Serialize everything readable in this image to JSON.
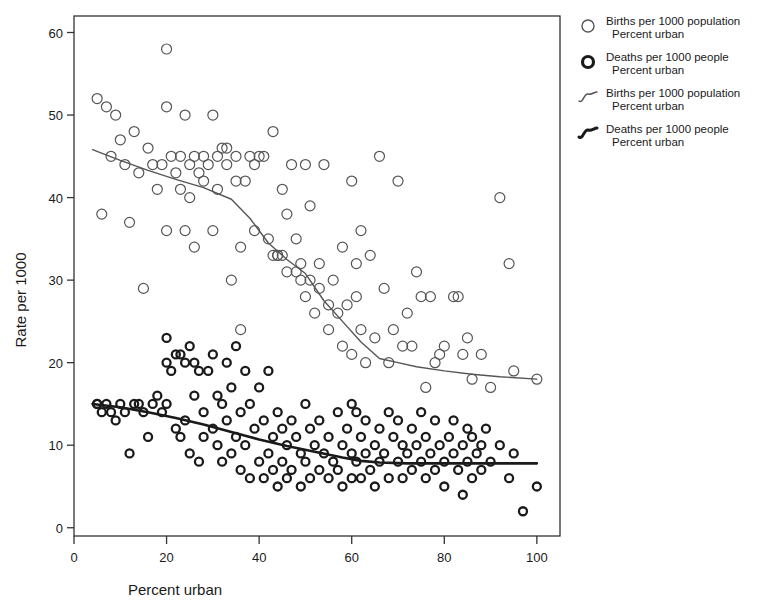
{
  "chart_data": {
    "type": "scatter",
    "title": "",
    "xlabel": "Percent urban",
    "ylabel": "Rate per 1000",
    "xlim": [
      0,
      105
    ],
    "ylim": [
      -1,
      62
    ],
    "xticks": [
      0,
      20,
      40,
      60,
      80,
      100
    ],
    "yticks": [
      0,
      10,
      20,
      30,
      40,
      50,
      60
    ],
    "grid": false,
    "legend_position": "right",
    "series": [
      {
        "name": "Births per 1000 population",
        "sub": "Percent urban",
        "marker": "open-circle",
        "color": "#555555",
        "points": [
          [
            5,
            52
          ],
          [
            6,
            38
          ],
          [
            7,
            51
          ],
          [
            8,
            45
          ],
          [
            9,
            50
          ],
          [
            10,
            47
          ],
          [
            11,
            44
          ],
          [
            12,
            37
          ],
          [
            13,
            48
          ],
          [
            14,
            43
          ],
          [
            15,
            29
          ],
          [
            16,
            46
          ],
          [
            17,
            44
          ],
          [
            18,
            41
          ],
          [
            19,
            44
          ],
          [
            20,
            58
          ],
          [
            20,
            51
          ],
          [
            20,
            36
          ],
          [
            21,
            45
          ],
          [
            22,
            43
          ],
          [
            23,
            45
          ],
          [
            23,
            41
          ],
          [
            24,
            50
          ],
          [
            24,
            36
          ],
          [
            25,
            44
          ],
          [
            25,
            40
          ],
          [
            26,
            45
          ],
          [
            26,
            34
          ],
          [
            27,
            43
          ],
          [
            28,
            42
          ],
          [
            28,
            45
          ],
          [
            29,
            44
          ],
          [
            30,
            50
          ],
          [
            30,
            36
          ],
          [
            31,
            45
          ],
          [
            31,
            41
          ],
          [
            32,
            46
          ],
          [
            33,
            44
          ],
          [
            33,
            46
          ],
          [
            34,
            30
          ],
          [
            35,
            45
          ],
          [
            35,
            42
          ],
          [
            36,
            34
          ],
          [
            36,
            24
          ],
          [
            37,
            42
          ],
          [
            38,
            45
          ],
          [
            39,
            44
          ],
          [
            39,
            36
          ],
          [
            40,
            45
          ],
          [
            41,
            45
          ],
          [
            42,
            35
          ],
          [
            43,
            48
          ],
          [
            43,
            33
          ],
          [
            44,
            33
          ],
          [
            44,
            33
          ],
          [
            45,
            33
          ],
          [
            45,
            41
          ],
          [
            46,
            38
          ],
          [
            46,
            31
          ],
          [
            47,
            44
          ],
          [
            48,
            35
          ],
          [
            48,
            31
          ],
          [
            49,
            30
          ],
          [
            49,
            32
          ],
          [
            50,
            44
          ],
          [
            50,
            28
          ],
          [
            51,
            39
          ],
          [
            51,
            30
          ],
          [
            52,
            26
          ],
          [
            53,
            32
          ],
          [
            53,
            29
          ],
          [
            54,
            44
          ],
          [
            55,
            24
          ],
          [
            55,
            27
          ],
          [
            56,
            30
          ],
          [
            57,
            26
          ],
          [
            58,
            22
          ],
          [
            58,
            34
          ],
          [
            59,
            27
          ],
          [
            60,
            42
          ],
          [
            60,
            21
          ],
          [
            61,
            32
          ],
          [
            61,
            28
          ],
          [
            62,
            36
          ],
          [
            62,
            24
          ],
          [
            63,
            20
          ],
          [
            64,
            33
          ],
          [
            65,
            23
          ],
          [
            66,
            45
          ],
          [
            67,
            29
          ],
          [
            68,
            20
          ],
          [
            69,
            24
          ],
          [
            70,
            42
          ],
          [
            71,
            22
          ],
          [
            72,
            26
          ],
          [
            73,
            22
          ],
          [
            74,
            31
          ],
          [
            75,
            28
          ],
          [
            76,
            17
          ],
          [
            77,
            28
          ],
          [
            78,
            20
          ],
          [
            79,
            21
          ],
          [
            80,
            22
          ],
          [
            82,
            28
          ],
          [
            83,
            28
          ],
          [
            84,
            21
          ],
          [
            85,
            23
          ],
          [
            86,
            18
          ],
          [
            88,
            21
          ],
          [
            90,
            17
          ],
          [
            92,
            40
          ],
          [
            94,
            32
          ],
          [
            95,
            19
          ],
          [
            100,
            18
          ]
        ]
      },
      {
        "name": "Deaths per 1000 people",
        "sub": "Percent urban",
        "marker": "filled-ring",
        "color": "#1a1a1a",
        "points": [
          [
            5,
            15
          ],
          [
            5,
            15
          ],
          [
            6,
            14
          ],
          [
            7,
            15
          ],
          [
            8,
            14
          ],
          [
            9,
            13
          ],
          [
            10,
            15
          ],
          [
            11,
            14
          ],
          [
            12,
            9
          ],
          [
            13,
            15
          ],
          [
            14,
            15
          ],
          [
            15,
            14
          ],
          [
            16,
            11
          ],
          [
            17,
            15
          ],
          [
            18,
            16
          ],
          [
            19,
            14
          ],
          [
            20,
            23
          ],
          [
            20,
            20
          ],
          [
            20,
            15
          ],
          [
            21,
            19
          ],
          [
            22,
            21
          ],
          [
            22,
            12
          ],
          [
            23,
            21
          ],
          [
            23,
            11
          ],
          [
            24,
            20
          ],
          [
            24,
            13
          ],
          [
            25,
            22
          ],
          [
            25,
            9
          ],
          [
            26,
            16
          ],
          [
            26,
            20
          ],
          [
            27,
            19
          ],
          [
            27,
            8
          ],
          [
            28,
            14
          ],
          [
            28,
            11
          ],
          [
            29,
            19
          ],
          [
            30,
            21
          ],
          [
            30,
            12
          ],
          [
            31,
            16
          ],
          [
            31,
            10
          ],
          [
            32,
            15
          ],
          [
            32,
            8
          ],
          [
            33,
            20
          ],
          [
            33,
            13
          ],
          [
            34,
            17
          ],
          [
            34,
            9
          ],
          [
            35,
            22
          ],
          [
            35,
            11
          ],
          [
            36,
            14
          ],
          [
            36,
            7
          ],
          [
            37,
            19
          ],
          [
            37,
            10
          ],
          [
            38,
            15
          ],
          [
            38,
            6
          ],
          [
            39,
            12
          ],
          [
            40,
            17
          ],
          [
            40,
            8
          ],
          [
            41,
            13
          ],
          [
            41,
            6
          ],
          [
            42,
            19
          ],
          [
            42,
            9
          ],
          [
            43,
            11
          ],
          [
            43,
            7
          ],
          [
            44,
            14
          ],
          [
            44,
            5
          ],
          [
            45,
            12
          ],
          [
            45,
            8
          ],
          [
            46,
            10
          ],
          [
            46,
            6
          ],
          [
            47,
            13
          ],
          [
            47,
            7
          ],
          [
            48,
            11
          ],
          [
            49,
            9
          ],
          [
            49,
            5
          ],
          [
            50,
            15
          ],
          [
            50,
            8
          ],
          [
            51,
            12
          ],
          [
            51,
            6
          ],
          [
            52,
            10
          ],
          [
            53,
            13
          ],
          [
            53,
            7
          ],
          [
            54,
            9
          ],
          [
            55,
            11
          ],
          [
            55,
            6
          ],
          [
            56,
            8
          ],
          [
            57,
            14
          ],
          [
            57,
            7
          ],
          [
            58,
            10
          ],
          [
            58,
            5
          ],
          [
            59,
            12
          ],
          [
            60,
            15
          ],
          [
            60,
            9
          ],
          [
            60,
            6
          ],
          [
            61,
            14
          ],
          [
            61,
            8
          ],
          [
            62,
            11
          ],
          [
            62,
            6
          ],
          [
            63,
            9
          ],
          [
            63,
            13
          ],
          [
            64,
            7
          ],
          [
            65,
            10
          ],
          [
            65,
            5
          ],
          [
            66,
            12
          ],
          [
            66,
            8
          ],
          [
            67,
            9
          ],
          [
            68,
            14
          ],
          [
            68,
            6
          ],
          [
            69,
            11
          ],
          [
            70,
            8
          ],
          [
            70,
            13
          ],
          [
            71,
            10
          ],
          [
            71,
            6
          ],
          [
            72,
            9
          ],
          [
            73,
            12
          ],
          [
            73,
            7
          ],
          [
            74,
            10
          ],
          [
            75,
            8
          ],
          [
            75,
            14
          ],
          [
            76,
            11
          ],
          [
            76,
            6
          ],
          [
            77,
            9
          ],
          [
            78,
            13
          ],
          [
            78,
            7
          ],
          [
            79,
            10
          ],
          [
            80,
            8
          ],
          [
            80,
            5
          ],
          [
            81,
            11
          ],
          [
            82,
            9
          ],
          [
            82,
            13
          ],
          [
            83,
            7
          ],
          [
            84,
            10
          ],
          [
            84,
            4
          ],
          [
            85,
            12
          ],
          [
            85,
            8
          ],
          [
            86,
            11
          ],
          [
            86,
            6
          ],
          [
            87,
            9
          ],
          [
            88,
            10
          ],
          [
            88,
            7
          ],
          [
            89,
            12
          ],
          [
            90,
            8
          ],
          [
            92,
            10
          ],
          [
            94,
            6
          ],
          [
            95,
            9
          ],
          [
            97,
            2
          ],
          [
            100,
            5
          ]
        ]
      }
    ],
    "trend_lines": [
      {
        "name": "Births per 1000 population",
        "sub": "Percent urban",
        "style": "thin",
        "color": "#555555",
        "points": [
          [
            4,
            45.8
          ],
          [
            10,
            44.5
          ],
          [
            16,
            43.3
          ],
          [
            22,
            42.2
          ],
          [
            28,
            41.2
          ],
          [
            34,
            39.8
          ],
          [
            38,
            37.5
          ],
          [
            42,
            34.5
          ],
          [
            46,
            32.5
          ],
          [
            50,
            30.8
          ],
          [
            54,
            27.5
          ],
          [
            58,
            25.0
          ],
          [
            62,
            22.5
          ],
          [
            66,
            20.5
          ],
          [
            70,
            20.0
          ],
          [
            74,
            19.5
          ],
          [
            80,
            19.0
          ],
          [
            86,
            18.6
          ],
          [
            92,
            18.3
          ],
          [
            100,
            18.0
          ]
        ]
      },
      {
        "name": "Deaths per 1000 people",
        "sub": "Percent urban",
        "style": "thick",
        "color": "#1a1a1a",
        "points": [
          [
            4,
            15.0
          ],
          [
            10,
            14.6
          ],
          [
            16,
            14.0
          ],
          [
            22,
            13.3
          ],
          [
            28,
            12.5
          ],
          [
            34,
            11.6
          ],
          [
            40,
            10.7
          ],
          [
            46,
            9.9
          ],
          [
            52,
            9.2
          ],
          [
            58,
            8.5
          ],
          [
            62,
            8.1
          ],
          [
            66,
            7.9
          ],
          [
            72,
            7.8
          ],
          [
            80,
            7.8
          ],
          [
            88,
            7.8
          ],
          [
            94,
            7.8
          ],
          [
            100,
            7.8
          ]
        ]
      }
    ]
  },
  "legend": {
    "items": [
      {
        "label": "Births per 1000 population",
        "sublabel": "Percent urban",
        "glyph": "open-circle-icon"
      },
      {
        "label": "Deaths per 1000 people",
        "sublabel": "Percent urban",
        "glyph": "filled-ring-icon"
      },
      {
        "label": "Births per 1000 population",
        "sublabel": "Percent urban",
        "glyph": "thin-curve-icon"
      },
      {
        "label": "Deaths per 1000 people",
        "sublabel": "Percent urban",
        "glyph": "thick-curve-icon"
      }
    ]
  },
  "axes": {
    "x_title": "Percent urban",
    "y_title": "Rate per 1000",
    "x_tick_labels": [
      "0",
      "20",
      "40",
      "60",
      "80",
      "100"
    ],
    "y_tick_labels": [
      "0",
      "10",
      "20",
      "30",
      "40",
      "50",
      "60"
    ]
  },
  "colors": {
    "births": "#555555",
    "deaths": "#1a1a1a",
    "frame": "#333333",
    "background": "#ffffff"
  }
}
